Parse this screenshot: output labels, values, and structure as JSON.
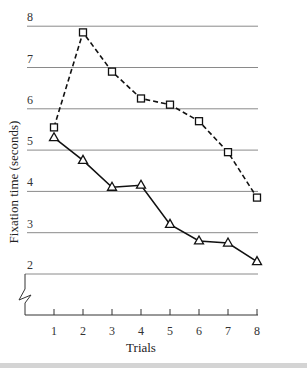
{
  "chart_data": {
    "type": "line",
    "title": "",
    "xlabel": "Trials",
    "ylabel": "Fixation time (seconds)",
    "x": [
      1,
      2,
      3,
      4,
      5,
      6,
      7,
      8
    ],
    "x_tick_labels": [
      "1",
      "2",
      "3",
      "4",
      "5",
      "6",
      "7",
      "8"
    ],
    "y_tick_labels": [
      "2",
      "3",
      "4",
      "5",
      "6",
      "7",
      "8"
    ],
    "ylim": [
      2,
      8
    ],
    "y_axis_break": true,
    "grid": "horizontal",
    "legend": null,
    "series": [
      {
        "name": "squares (dashed)",
        "marker": "square",
        "line_style": "dashed",
        "values": [
          5.55,
          7.85,
          6.9,
          6.25,
          6.1,
          5.7,
          4.95,
          3.85
        ]
      },
      {
        "name": "triangles (solid)",
        "marker": "triangle",
        "line_style": "solid",
        "values": [
          5.3,
          4.75,
          4.1,
          4.15,
          3.2,
          2.8,
          2.75,
          2.3
        ]
      }
    ]
  },
  "colors": {
    "grid": "#8a8a8a",
    "line": "#111111",
    "bottom_bar": "#d4d4d4"
  }
}
